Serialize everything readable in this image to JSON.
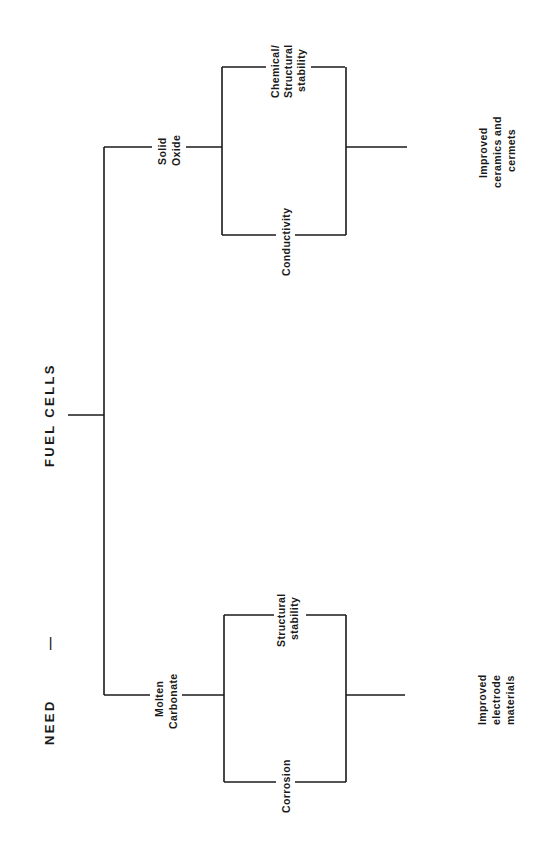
{
  "diagram": {
    "header": {
      "need": "NEED",
      "dash": "—",
      "topic": "FUEL CELLS"
    },
    "branches": [
      {
        "name": "Solid Oxide",
        "label_lines": [
          "Solid",
          "Oxide"
        ],
        "issues": [
          {
            "label_lines": [
              "Chemical/",
              "Structural",
              "stability"
            ]
          },
          {
            "label_lines": [
              "Conductivity"
            ]
          }
        ],
        "outcome_lines": [
          "Improved",
          "ceramics and",
          "cermets"
        ]
      },
      {
        "name": "Molten Carbonate",
        "label_lines": [
          "Molten",
          "Carbonate"
        ],
        "issues": [
          {
            "label_lines": [
              "Structural",
              "stability"
            ]
          },
          {
            "label_lines": [
              "Corrosion"
            ]
          }
        ],
        "outcome_lines": [
          "Improved",
          "electrode",
          "materials"
        ]
      }
    ],
    "colors": {
      "ink": "#1a1a1a",
      "background": "#ffffff"
    }
  }
}
